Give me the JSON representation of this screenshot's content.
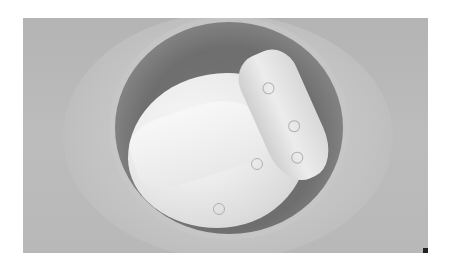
{
  "image": {
    "description": "Grayscale photo of a round bin lined with a plastic bag containing a used disposable diaper and a rolled-up diaper",
    "colors": {
      "background": "#b8b8b8",
      "bin_interior": "#707070",
      "bag": "#c6c6c6",
      "diaper": "#ececec"
    },
    "objects": [
      "floor-background",
      "plastic-bag",
      "bin",
      "open-diaper",
      "rolled-diaper"
    ]
  }
}
